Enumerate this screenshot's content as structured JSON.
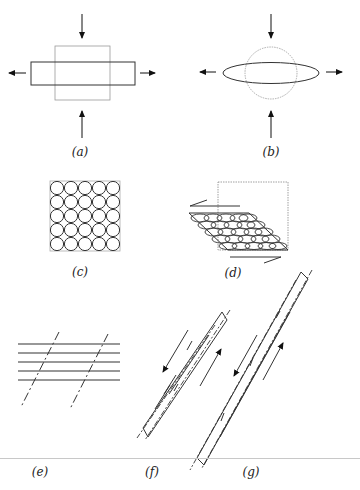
{
  "figure": {
    "panels": [
      {
        "id": "a",
        "label": "(a)",
        "description": "square deformed to rectangle under vertical compression and horizontal extension"
      },
      {
        "id": "b",
        "label": "(b)",
        "description": "circle deformed to ellipse under vertical compression and horizontal extension"
      },
      {
        "id": "c",
        "label": "(c)",
        "description": "5x5 grid of circles in a square"
      },
      {
        "id": "d",
        "label": "(d)",
        "description": "grid sheared into parallelogram with ellipses; shear arrows"
      },
      {
        "id": "e",
        "label": "(e)",
        "description": "parallel horizontal layers cut by two dashed oblique lines"
      },
      {
        "id": "f",
        "label": "(f)",
        "description": "rotated layers with slip arrows"
      },
      {
        "id": "g",
        "label": "(g)",
        "description": "further rotated and elongated layers with slip arrows"
      }
    ],
    "colors": {
      "stroke": "#333333",
      "light_stroke": "#888888",
      "separator": "#c8c8c8"
    }
  }
}
